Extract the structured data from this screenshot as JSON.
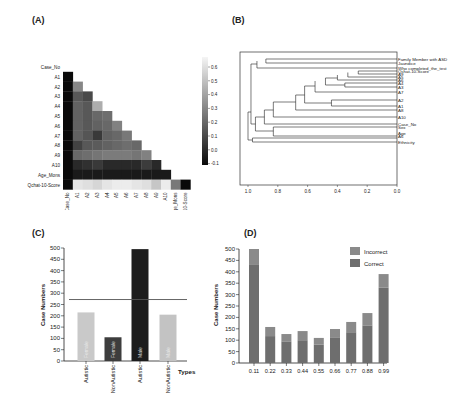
{
  "panels": {
    "a": {
      "label": "(A)"
    },
    "b": {
      "label": "(B)"
    },
    "c": {
      "label": "(C)"
    },
    "d": {
      "label": "(D)"
    }
  },
  "chart_data": [
    {
      "id": "A",
      "type": "heatmap",
      "title": "",
      "labels": [
        "Case_No",
        "A1",
        "A2",
        "A3",
        "A4",
        "A5",
        "A6",
        "A7",
        "A8",
        "A9",
        "A10",
        "Age_Mons",
        "Qchat-10-Score"
      ],
      "colorbar": {
        "min": -0.1,
        "max": 0.65,
        "ticks": [
          "0.6",
          "0.5",
          "0.4",
          "0.3",
          "0.2",
          "0.1",
          "0.0",
          "-0.1"
        ]
      },
      "lower_triangle_values": [
        [],
        [
          -0.1
        ],
        [
          -0.1,
          0.3
        ],
        [
          -0.1,
          0.15,
          0.1
        ],
        [
          -0.1,
          0.18,
          0.15,
          0.42
        ],
        [
          -0.1,
          0.18,
          0.15,
          0.2,
          0.22
        ],
        [
          -0.1,
          0.18,
          0.15,
          0.18,
          0.2,
          0.28
        ],
        [
          -0.1,
          0.18,
          0.14,
          0.05,
          0.18,
          0.2,
          0.25
        ],
        [
          -0.1,
          0.08,
          0.15,
          0.16,
          0.18,
          0.2,
          0.22,
          0.2
        ],
        [
          -0.1,
          0.2,
          0.22,
          0.24,
          0.26,
          0.26,
          0.26,
          0.24,
          0.28
        ],
        [
          -0.1,
          0.0,
          0.02,
          0.05,
          0.0,
          0.0,
          0.0,
          0.0,
          0.06,
          0.0
        ],
        [
          -0.1,
          -0.05,
          -0.05,
          -0.05,
          -0.05,
          -0.05,
          -0.05,
          -0.05,
          -0.05,
          -0.05,
          -0.05
        ],
        [
          -0.1,
          0.6,
          0.58,
          0.55,
          0.6,
          0.62,
          0.62,
          0.6,
          0.58,
          0.5,
          0.62,
          0.25,
          -0.1
        ]
      ]
    },
    {
      "id": "B",
      "type": "dendrogram",
      "leaves": [
        "Family Member with ASD",
        "Jaundice",
        "Who completed_the_test",
        "Qchat-10-Score",
        "A9",
        "A5",
        "A6",
        "A4",
        "A3",
        "A7",
        "A2",
        "A1",
        "A8",
        "A10",
        "Case_No",
        "Sex",
        "Age",
        "A6",
        "Ethnicity"
      ],
      "x_ticks": [
        "1.0",
        "0.8",
        "0.6",
        "0.4",
        "0.2",
        "0.0"
      ],
      "xlim": [
        1.0,
        0.0
      ]
    },
    {
      "id": "C",
      "type": "bar",
      "title": "",
      "categories": [
        "Autistic-Female",
        "NonAutistic-Female",
        "Autistic-Male",
        "NonAutistic-Male"
      ],
      "tick_labels": [
        "Autistic",
        "NonAutistic",
        "Autistic",
        "NonAutistic"
      ],
      "bar_labels": [
        "Female",
        "Female",
        "Male",
        "Male"
      ],
      "values": [
        215,
        105,
        495,
        205
      ],
      "colors": [
        "#c9c9c9",
        "#3d3d3d",
        "#1c1c1c",
        "#c3c3c3"
      ],
      "reference_line": 272,
      "xlabel": "Types",
      "ylabel": "Case Numbers",
      "ylim": [
        0,
        500
      ],
      "yticks": [
        0,
        50,
        100,
        150,
        200,
        250,
        300,
        350,
        400,
        450,
        500
      ]
    },
    {
      "id": "D",
      "type": "bar",
      "stacked": true,
      "categories": [
        "0.11",
        "0.22",
        "0.33",
        "0.44",
        "0.55",
        "0.66",
        "0.77",
        "0.88",
        "0.99"
      ],
      "series": [
        {
          "name": "Correct",
          "values": [
            430,
            118,
            95,
            100,
            80,
            110,
            135,
            165,
            330
          ],
          "color": "#6e6e6e"
        },
        {
          "name": "Incorrect",
          "values": [
            70,
            40,
            32,
            40,
            30,
            39,
            45,
            54,
            60
          ],
          "color": "#8a8a8a"
        }
      ],
      "totals": [
        500,
        158,
        127,
        140,
        110,
        149,
        180,
        219,
        390
      ],
      "legend": [
        "Incorrect",
        "Correct"
      ],
      "xlabel": "",
      "ylabel": "Case Numbers",
      "ylim": [
        0,
        500
      ],
      "yticks": [
        0,
        50,
        100,
        150,
        200,
        250,
        300,
        350,
        400,
        450,
        500
      ]
    }
  ]
}
